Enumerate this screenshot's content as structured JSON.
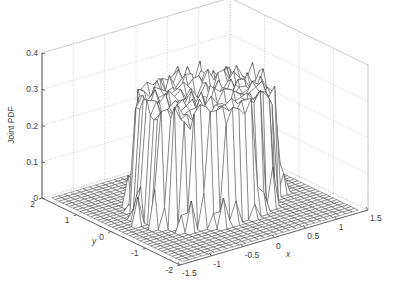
{
  "chart_data": {
    "type": "surface3d",
    "title": "",
    "xlabel": "x",
    "ylabel": "y",
    "zlabel": "Joint PDF",
    "xlim": [
      -1.5,
      1.5
    ],
    "ylim": [
      -2,
      2
    ],
    "zlim": [
      0,
      0.4
    ],
    "xticks": [
      "-1.5",
      "-1",
      "-0.5",
      "0",
      "0.5",
      "1",
      "1.5"
    ],
    "xtick_values": [
      -1.5,
      -1,
      -0.5,
      0,
      0.5,
      1,
      1.5
    ],
    "yticks": [
      "-2",
      "-1",
      "0",
      "1",
      "2"
    ],
    "ytick_values": [
      -2,
      -1,
      0,
      1,
      2
    ],
    "zticks": [
      "0",
      "0.1",
      "0.2",
      "0.3",
      "0.4"
    ],
    "ztick_values": [
      0,
      0.1,
      0.2,
      0.3,
      0.4
    ],
    "grid": true,
    "box": true,
    "surface": {
      "mesh_x_range": [
        -1.4,
        1.4
      ],
      "mesh_y_range": [
        -1.9,
        1.9
      ],
      "mesh_nx": 29,
      "mesh_ny": 38,
      "plateau_center": [
        0,
        0
      ],
      "plateau_radius": 1.0,
      "plateau_mean_height": 0.3,
      "plateau_noise": 0.035,
      "floor_height": 0.0
    },
    "colors": {
      "mesh_edge": "#3a3a3a",
      "face": "#ffffff",
      "grid": "#c8c8c8",
      "axis": "#555555",
      "text": "#444444"
    }
  }
}
